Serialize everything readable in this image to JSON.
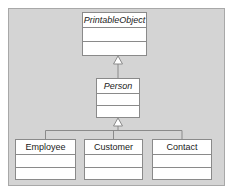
{
  "diagram": {
    "type": "uml-class-diagram",
    "title": "",
    "background_color": "#d4d4d4",
    "frame_border_color": "#a8a8a8",
    "box_fill_color": "#ffffff",
    "box_border_color": "#8a8a8a",
    "line_color": "#8a8a8a",
    "text_color": "#1a1a1a"
  },
  "classes": [
    {
      "id": "printable-object",
      "name": "PrintableObject",
      "abstract": true,
      "attributes": [],
      "operations": [],
      "x": 82,
      "y": 12,
      "width": 65,
      "height": 44
    },
    {
      "id": "person",
      "name": "Person",
      "abstract": true,
      "attributes": [],
      "operations": [],
      "x": 96,
      "y": 78,
      "width": 44,
      "height": 40
    },
    {
      "id": "employee",
      "name": "Employee",
      "abstract": false,
      "attributes": [],
      "operations": [],
      "x": 15,
      "y": 139,
      "width": 61,
      "height": 41
    },
    {
      "id": "customer",
      "name": "Customer",
      "abstract": false,
      "attributes": [],
      "operations": [],
      "x": 84,
      "y": 139,
      "width": 59,
      "height": 41
    },
    {
      "id": "contact",
      "name": "Contact",
      "abstract": false,
      "attributes": [],
      "operations": [],
      "x": 152,
      "y": 139,
      "width": 60,
      "height": 41
    }
  ],
  "relationships": [
    {
      "kind": "generalization",
      "from": "person",
      "to": "printable-object",
      "arrowhead": "hollow-triangle"
    },
    {
      "kind": "generalization",
      "from": "employee",
      "to": "person",
      "arrowhead": "hollow-triangle"
    },
    {
      "kind": "generalization",
      "from": "customer",
      "to": "person",
      "arrowhead": "hollow-triangle"
    },
    {
      "kind": "generalization",
      "from": "contact",
      "to": "person",
      "arrowhead": "hollow-triangle"
    }
  ]
}
